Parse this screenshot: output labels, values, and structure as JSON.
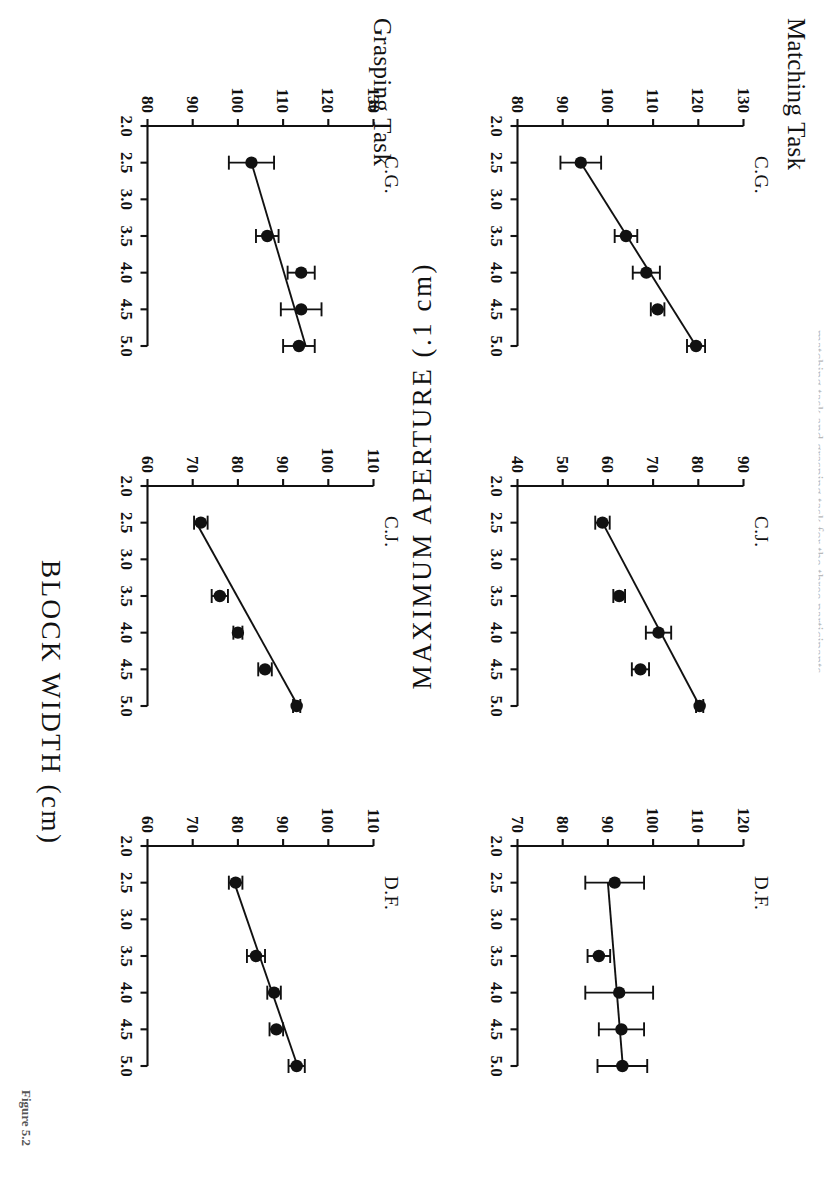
{
  "figure": {
    "caption": "Figure 5.2",
    "top_cut_text": "matching task and grasping task for the three participants",
    "axis_titles": {
      "x": "BLOCK  WIDTH  (cm)",
      "y": "MAXIMUM  APERTURE  (.1 cm)"
    },
    "task_labels": {
      "matching": "Matching Task",
      "grasping": "Grasping Task"
    }
  },
  "chart_data": [
    {
      "type": "scatter",
      "title": "C.G.",
      "task": "Matching Task",
      "subject": "C.G.",
      "xlabel": "BLOCK  WIDTH  (cm)",
      "ylabel": "MAXIMUM  APERTURE  (.1 cm)",
      "xlim": [
        2.0,
        5.0
      ],
      "ylim": [
        80,
        130
      ],
      "xticks": [
        "2.0",
        "2.5",
        "3.0",
        "3.5",
        "4.0",
        "4.5",
        "5.0"
      ],
      "yticks": [
        "80",
        "90",
        "100",
        "110",
        "120",
        "130"
      ],
      "grid": false,
      "legend": "none",
      "x": [
        2.5,
        3.5,
        4.0,
        4.5,
        5.0
      ],
      "values": [
        94.0,
        104.0,
        108.5,
        111.0,
        119.5
      ],
      "errors": [
        4.5,
        2.5,
        3.0,
        1.5,
        2.0
      ],
      "fit": {
        "x": [
          2.5,
          5.0
        ],
        "y": [
          94.0,
          119.5
        ]
      }
    },
    {
      "type": "scatter",
      "title": "C.J.",
      "task": "Matching Task",
      "subject": "C.J.",
      "xlabel": "BLOCK  WIDTH  (cm)",
      "ylabel": "MAXIMUM  APERTURE  (.1 cm)",
      "xlim": [
        2.0,
        5.0
      ],
      "ylim": [
        40,
        90
      ],
      "xticks": [
        "2.0",
        "2.5",
        "3.0",
        "3.5",
        "4.0",
        "4.5",
        "5.0"
      ],
      "yticks": [
        "40",
        "50",
        "60",
        "70",
        "80",
        "90"
      ],
      "grid": false,
      "legend": "none",
      "x": [
        2.5,
        3.5,
        4.0,
        4.5,
        5.0
      ],
      "values": [
        58.8,
        62.5,
        71.2,
        67.2,
        80.3
      ],
      "errors": [
        1.6,
        1.3,
        2.8,
        1.9,
        0.8
      ],
      "fit": {
        "x": [
          2.5,
          5.0
        ],
        "y": [
          58.8,
          80.3
        ]
      }
    },
    {
      "type": "scatter",
      "title": "D.F.",
      "task": "Matching Task",
      "subject": "D.F.",
      "xlabel": "BLOCK  WIDTH  (cm)",
      "ylabel": "MAXIMUM  APERTURE  (.1 cm)",
      "xlim": [
        2.0,
        5.0
      ],
      "ylim": [
        70,
        120
      ],
      "xticks": [
        "2.0",
        "2.5",
        "3.0",
        "3.5",
        "4.0",
        "4.5",
        "5.0"
      ],
      "yticks": [
        "70",
        "80",
        "90",
        "100",
        "110",
        "120"
      ],
      "grid": false,
      "legend": "none",
      "x": [
        2.5,
        3.5,
        4.0,
        4.5,
        5.0
      ],
      "values": [
        91.5,
        88.0,
        92.5,
        93.0,
        93.2
      ],
      "errors": [
        6.5,
        2.5,
        7.5,
        5.0,
        5.5
      ],
      "fit": {
        "x": [
          2.5,
          5.0
        ],
        "y": [
          90.0,
          93.3
        ]
      }
    },
    {
      "type": "scatter",
      "title": "C.G.",
      "task": "Grasping Task",
      "subject": "C.G.",
      "xlabel": "BLOCK  WIDTH  (cm)",
      "ylabel": "MAXIMUM  APERTURE  (.1 cm)",
      "xlim": [
        2.0,
        5.0
      ],
      "ylim": [
        80,
        130
      ],
      "xticks": [
        "2.0",
        "2.5",
        "3.0",
        "3.5",
        "4.0",
        "4.5",
        "5.0"
      ],
      "yticks": [
        "80",
        "90",
        "100",
        "110",
        "120",
        "130"
      ],
      "grid": false,
      "legend": "none",
      "x": [
        2.5,
        3.5,
        4.0,
        4.5,
        5.0
      ],
      "values": [
        103.0,
        106.5,
        114.0,
        114.0,
        113.5
      ],
      "errors": [
        5.0,
        2.5,
        3.0,
        4.5,
        3.5
      ],
      "fit": {
        "x": [
          2.5,
          5.0
        ],
        "y": [
          103.0,
          115.0
        ]
      }
    },
    {
      "type": "scatter",
      "title": "C.J.",
      "task": "Grasping Task",
      "subject": "C.J.",
      "xlabel": "BLOCK  WIDTH  (cm)",
      "ylabel": "MAXIMUM  APERTURE  (.1 cm)",
      "xlim": [
        2.0,
        5.0
      ],
      "ylim": [
        60,
        110
      ],
      "xticks": [
        "2.0",
        "2.5",
        "3.0",
        "3.5",
        "4.0",
        "4.5",
        "5.0"
      ],
      "yticks": [
        "60",
        "70",
        "80",
        "90",
        "100",
        "110"
      ],
      "grid": false,
      "legend": "none",
      "x": [
        2.5,
        3.5,
        4.0,
        4.5,
        5.0
      ],
      "values": [
        71.8,
        76.0,
        80.0,
        86.0,
        93.0
      ],
      "errors": [
        1.5,
        1.8,
        1.0,
        1.5,
        0.8
      ],
      "fit": {
        "x": [
          2.5,
          5.0
        ],
        "y": [
          70.8,
          93.3
        ]
      }
    },
    {
      "type": "scatter",
      "title": "D.F.",
      "task": "Grasping Task",
      "subject": "D.F.",
      "xlabel": "BLOCK  WIDTH  (cm)",
      "ylabel": "MAXIMUM  APERTURE  (.1 cm)",
      "xlim": [
        2.0,
        5.0
      ],
      "ylim": [
        60,
        110
      ],
      "xticks": [
        "2.0",
        "2.5",
        "3.0",
        "3.5",
        "4.0",
        "4.5",
        "5.0"
      ],
      "yticks": [
        "60",
        "70",
        "80",
        "90",
        "100",
        "110"
      ],
      "grid": false,
      "legend": "none",
      "x": [
        2.5,
        3.5,
        4.0,
        4.5,
        5.0
      ],
      "values": [
        79.5,
        84.0,
        88.0,
        88.5,
        93.0
      ],
      "errors": [
        1.5,
        2.0,
        1.5,
        1.5,
        1.8
      ],
      "fit": {
        "x": [
          2.5,
          5.0
        ],
        "y": [
          79.2,
          93.2
        ]
      }
    }
  ],
  "colors": {
    "ink": "#111111",
    "paper": "#ffffff"
  }
}
